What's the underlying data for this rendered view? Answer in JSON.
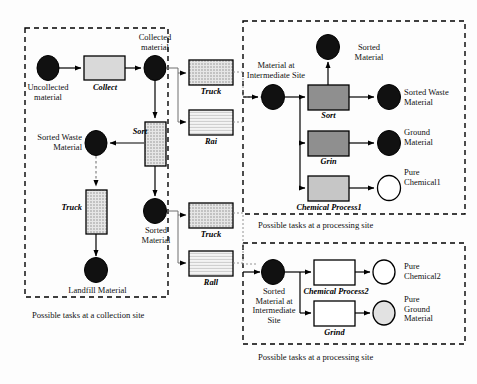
{
  "diagram": {
    "type": "flow-diagram",
    "captions": {
      "collection": "Possible tasks at a collection site",
      "processing_top": "Possible tasks at a processing site",
      "processing_bottom": "Possible tasks at a processing site"
    },
    "colors": {
      "outline": "#000000",
      "background": "#ffffff",
      "place_filled": "#111111",
      "place_empty": "#ffffff",
      "place_light": "#e2e2e2",
      "task_gray_light": "#d9d9d9",
      "task_gray_mid": "#8f8f8f",
      "task_gray_pale": "#c6c6c6",
      "task_dotted": "#d0d0d0",
      "task_lined": "#ececec",
      "dashed_border": "#000000",
      "link_line": "#7a7a7a"
    },
    "sites": {
      "collection": {
        "name": "collection-site",
        "places": [
          {
            "id": "uncollected",
            "label": "Uncollected\nmaterial",
            "fill": "filled"
          },
          {
            "id": "collected",
            "label": "Collected\nmaterial",
            "fill": "filled"
          },
          {
            "id": "sorted_waste",
            "label": "Sorted Waste\nMaterial",
            "fill": "filled"
          },
          {
            "id": "landfill",
            "label": "Landfill Material",
            "fill": "filled"
          },
          {
            "id": "sorted_material",
            "label": "Sorted\nMaterial",
            "fill": "filled"
          }
        ],
        "tasks": [
          {
            "id": "collect",
            "label": "Collect",
            "fill": "gray-light"
          },
          {
            "id": "sort",
            "label": "Sort",
            "fill": "dotted"
          },
          {
            "id": "truck",
            "label": "Truck",
            "fill": "dotted"
          }
        ]
      },
      "transport_upper": {
        "name": "transport-upper",
        "tasks": [
          {
            "id": "truck_up",
            "label": "Truck",
            "fill": "dotted"
          },
          {
            "id": "rail_up",
            "label": "Rai",
            "fill": "lined"
          }
        ]
      },
      "transport_lower": {
        "name": "transport-lower",
        "tasks": [
          {
            "id": "truck_low",
            "label": "Truck",
            "fill": "dotted"
          },
          {
            "id": "rail_low",
            "label": "Rall",
            "fill": "lined"
          }
        ]
      },
      "processing_top": {
        "name": "processing-site-top",
        "places": [
          {
            "id": "material_intermediate",
            "label": "Material at\nIntermediate Site",
            "fill": "filled"
          },
          {
            "id": "sorted_material_out",
            "label": "Sorted\nMaterial",
            "fill": "filled"
          },
          {
            "id": "sorted_waste_out",
            "label": "Sorted Waste\nMaterial",
            "fill": "filled"
          },
          {
            "id": "ground_material",
            "label": "Ground\nMaterial",
            "fill": "filled"
          },
          {
            "id": "pure_chemical1",
            "label": "Pure\nChemical1",
            "fill": "empty"
          }
        ],
        "tasks": [
          {
            "id": "sort_p",
            "label": "Sort",
            "fill": "gray-mid"
          },
          {
            "id": "grind_p",
            "label": "Grin",
            "fill": "gray-mid"
          },
          {
            "id": "chem1_p",
            "label": "Chemical Process1",
            "fill": "gray-pale"
          }
        ]
      },
      "processing_bottom": {
        "name": "processing-site-bottom",
        "places": [
          {
            "id": "sorted_material_intermediate",
            "label": "Sorted\nMaterial at\nIntermediate\nSite",
            "fill": "filled"
          },
          {
            "id": "pure_chemical2",
            "label": "Pure\nChemical2",
            "fill": "empty"
          },
          {
            "id": "pure_ground",
            "label": "Pure\nGround\nMaterial",
            "fill": "light"
          }
        ],
        "tasks": [
          {
            "id": "chem2_b",
            "label": "Chemical Process2",
            "fill": "white"
          },
          {
            "id": "grind_b",
            "label": "Grind",
            "fill": "white"
          }
        ]
      }
    }
  }
}
